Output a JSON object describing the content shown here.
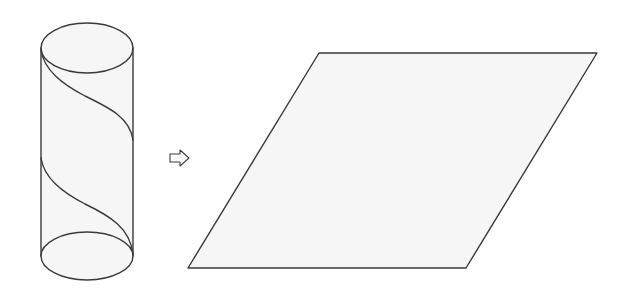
{
  "figure": {
    "colors": {
      "stroke": "#3a3a3a",
      "fill": "#f6f6f6",
      "background": "#ffffff"
    },
    "cylinder": {
      "top_ellipse": {
        "cx": 87,
        "cy": 48,
        "rx": 46,
        "ry": 25
      },
      "bottom_ellipse": {
        "cx": 87,
        "cy": 256,
        "rx": 46,
        "ry": 24
      },
      "left_x": 41,
      "right_x": 133,
      "helix_turns": 2
    },
    "arrow": {
      "icon": "hollow-right-arrow-icon",
      "glyph": "⇨"
    },
    "parallelogram": {
      "points": [
        [
          319,
          53
        ],
        [
          597,
          53
        ],
        [
          466,
          268
        ],
        [
          188,
          268
        ]
      ]
    }
  }
}
